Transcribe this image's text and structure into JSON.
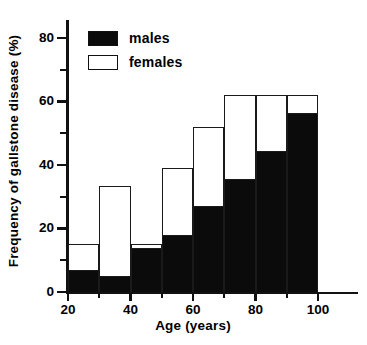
{
  "chart_data": {
    "type": "bar",
    "subtype": "stacked-histogram",
    "title": "",
    "xlabel": "Age (years)",
    "ylabel": "Frequency of gallstone disease (%)",
    "xlim": [
      20,
      100
    ],
    "ylim": [
      0,
      85
    ],
    "grid": false,
    "legend_position": "top-left",
    "x_major_ticks": [
      20,
      40,
      60,
      80,
      100
    ],
    "x_minor_ticks": [
      30,
      50,
      70,
      90
    ],
    "y_major_ticks": [
      0,
      20,
      40,
      60,
      80
    ],
    "y_minor_ticks": [
      10,
      30,
      50,
      70
    ],
    "bin_edges": [
      20,
      30,
      40,
      50,
      60,
      70,
      80,
      90,
      100
    ],
    "categories": [
      "20-30",
      "30-40",
      "40-50",
      "50-60",
      "60-70",
      "70-80",
      "80-90",
      "90-100"
    ],
    "series": [
      {
        "name": "males",
        "color": "#0b0b0b",
        "values": [
          7,
          5,
          14,
          18,
          27,
          35.5,
          44.5,
          56.5
        ]
      },
      {
        "name": "females",
        "color": "#ffffff",
        "note": "outline bar shows total height of each bin",
        "values": [
          15,
          33.5,
          15,
          39,
          52,
          62,
          62,
          62
        ]
      }
    ]
  },
  "legend": {
    "items": [
      {
        "label": "males",
        "style": "filled"
      },
      {
        "label": "females",
        "style": "hollow"
      }
    ]
  },
  "axes": {
    "x": {
      "label": "Age (years)",
      "tick_labels": [
        "20",
        "40",
        "60",
        "80",
        "100"
      ]
    },
    "y": {
      "label": "Frequency of gallstone disease (%)",
      "tick_labels": [
        "0",
        "20",
        "40",
        "60",
        "80"
      ]
    }
  }
}
